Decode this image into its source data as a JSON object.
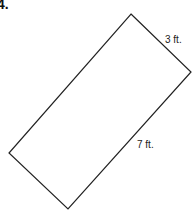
{
  "problem": {
    "number": "4."
  },
  "figure": {
    "shape": "rectangle",
    "vertices": [
      [
        131,
        14
      ],
      [
        191,
        72
      ],
      [
        68,
        209
      ],
      [
        9,
        153
      ]
    ],
    "stroke_color": "#222222",
    "labels": {
      "short_side": "3 ft.",
      "long_side": "7 ft."
    }
  }
}
